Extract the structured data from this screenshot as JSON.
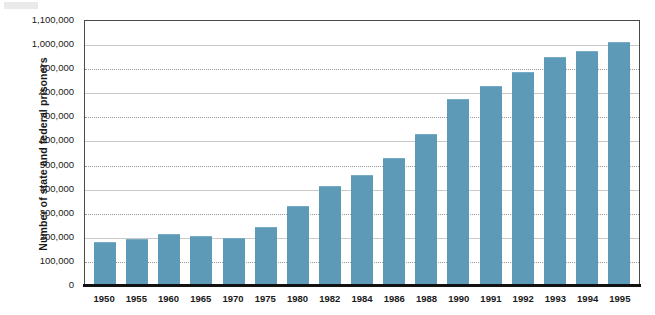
{
  "chart_data": {
    "type": "bar",
    "title": "",
    "subtitle": "",
    "xlabel": "",
    "ylabel": "Number of state and federal prisoners",
    "categories": [
      "1950",
      "1955",
      "1960",
      "1965",
      "1970",
      "1975",
      "1980",
      "1982",
      "1984",
      "1986",
      "1988",
      "1990",
      "1991",
      "1992",
      "1993",
      "1994",
      "1995"
    ],
    "values": [
      178000,
      193000,
      213000,
      205000,
      196000,
      241000,
      330000,
      412000,
      455000,
      527000,
      627000,
      773000,
      825000,
      883000,
      948000,
      970000,
      1010000
    ],
    "ylim": [
      0,
      1100000
    ],
    "ytick_values": [
      0,
      100000,
      200000,
      300000,
      400000,
      500000,
      600000,
      700000,
      800000,
      900000,
      1000000,
      1100000
    ],
    "ytick_labels": [
      "0",
      "100,000",
      "200,000",
      "300,000",
      "400,000",
      "500,000",
      "600,000",
      "700,000",
      "800,000",
      "900,000",
      "1,000,000",
      "1,100,000"
    ],
    "grid": true,
    "grid_style": "dotted-horizontal",
    "legend": "none",
    "bar_color": "#5c9ab8",
    "baseline_color": "#111111",
    "gridline_color": "#9a9a9a",
    "axis_color": "#4a4a4a",
    "background_color": "#ffffff"
  }
}
